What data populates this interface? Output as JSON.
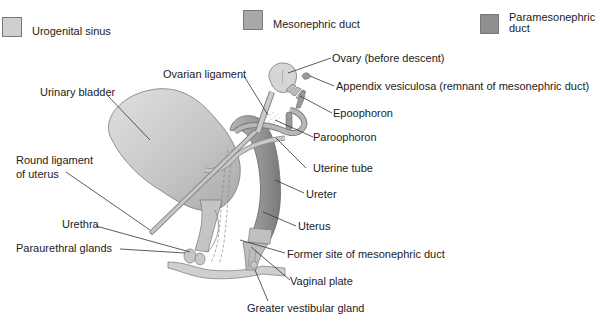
{
  "legend": [
    {
      "label": "Urogenital sinus",
      "color": "#cfcfcf"
    },
    {
      "label": "Mesonephric duct",
      "color": "#a9a9a9"
    },
    {
      "label": "Paramesonephric duct",
      "color": "#8f8f8f"
    }
  ],
  "labels": {
    "ovary": "Ovary (before descent)",
    "appendix_vesiculosa": "Appendix vesiculosa (remnant of mesonephric duct)",
    "epoophoron": "Epoophoron",
    "ovarian_ligament": "Ovarian ligament",
    "urinary_bladder": "Urinary bladder",
    "paroophoron": "Paroophoron",
    "uterine_tube": "Uterine tube",
    "round_ligament_line1": "Round ligament",
    "round_ligament_line2": "of uterus",
    "ureter": "Ureter",
    "uterus": "Uterus",
    "urethra": "Urethra",
    "paraurethral_glands": "Paraurethral glands",
    "former_site": "Former site of mesonephric duct",
    "vaginal_plate": "Vaginal plate",
    "greater_vestibular_gland": "Greater vestibular gland"
  }
}
